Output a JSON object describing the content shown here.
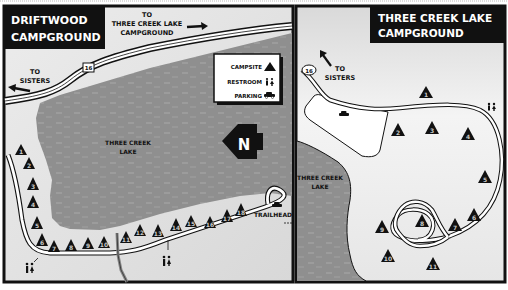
{
  "colors": {
    "lake": "#8f8f8f",
    "land_left": "#e2e2e2",
    "land_right": "#eeeeee",
    "ink": "#111111",
    "road": "#ffffff",
    "border": "#111111"
  },
  "left_map": {
    "title_line1": "DRIFTWOOD",
    "title_line2": "CAMPGROUND",
    "direction_east_line1": "TO",
    "direction_east_line2": "THREE CREEK LAKE",
    "direction_east_line3": "CAMPGROUND",
    "direction_west_line1": "TO",
    "direction_west_line2": "SISTERS",
    "route_number": "16",
    "lake_label_line1": "THREE CREEK",
    "lake_label_line2": "LAKE",
    "north_label": "N",
    "trailhead_label": "TRAILHEAD",
    "legend": {
      "campsite": "CAMPSITE",
      "restroom": "RESTROOM",
      "parking": "PARKING"
    },
    "campsites": [
      "1",
      "2",
      "3",
      "4",
      "5",
      "6",
      "7",
      "8",
      "9",
      "10",
      "11",
      "12",
      "13",
      "14",
      "15",
      "16",
      "17",
      "18"
    ]
  },
  "right_map": {
    "title_line1": "THREE CREEK LAKE",
    "title_line2": "CAMPGROUND",
    "direction_line1": "TO",
    "direction_line2": "SISTERS",
    "route_number": "16",
    "lake_label_line1": "THREE CREEK",
    "lake_label_line2": "LAKE",
    "campsites": [
      "1",
      "2",
      "3",
      "4",
      "5",
      "6",
      "7",
      "8",
      "9",
      "10",
      "11"
    ]
  }
}
